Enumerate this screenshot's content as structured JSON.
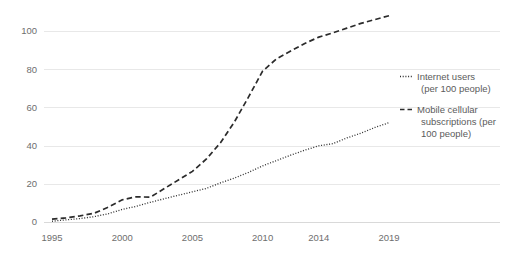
{
  "chart_data": {
    "type": "line",
    "title": "",
    "subtitle": "",
    "xlabel": "",
    "ylabel": "",
    "xlim": [
      1995,
      2019
    ],
    "ylim": [
      0,
      110
    ],
    "grid": true,
    "grid_axis": "y",
    "legend_position": "right",
    "x_tick_labels": [
      "1995",
      "2000",
      "2005",
      "2010",
      "2014",
      "2019"
    ],
    "x_tick_values": [
      1995,
      2000,
      2005,
      2010,
      2014,
      2019
    ],
    "y_tick_labels": [
      "0",
      "20",
      "40",
      "60",
      "80",
      "100"
    ],
    "y_tick_values": [
      0,
      20,
      40,
      60,
      80,
      100
    ],
    "x": [
      1995,
      1996,
      1997,
      1998,
      1999,
      2000,
      2001,
      2002,
      2003,
      2004,
      2005,
      2006,
      2007,
      2008,
      2009,
      2010,
      2011,
      2012,
      2013,
      2014,
      2015,
      2016,
      2017,
      2018,
      2019
    ],
    "series": [
      {
        "name": "Internet users (per 100 people)",
        "style": "dotted",
        "color": "#2b2b2b",
        "values": [
          0.4,
          1.1,
          1.8,
          2.8,
          4.3,
          6.6,
          8.2,
          10.3,
          12.2,
          14.0,
          15.8,
          17.6,
          20.5,
          23.0,
          26.0,
          29.4,
          32.2,
          35.0,
          37.6,
          39.9,
          41.0,
          44.0,
          46.5,
          49.5,
          52.0
        ]
      },
      {
        "name": "Mobile cellular subscriptions (per 100 people)",
        "style": "dashed",
        "color": "#2b2b2b",
        "values": [
          1.5,
          2.2,
          3.2,
          4.6,
          7.7,
          11.6,
          13.2,
          13.0,
          17.5,
          22.0,
          26.5,
          33.0,
          41.5,
          52.5,
          65.5,
          79.0,
          85.5,
          89.5,
          93.5,
          96.8,
          99.0,
          101.5,
          104.0,
          106.0,
          108.0
        ]
      }
    ],
    "legend": [
      {
        "label_line1": "Internet users",
        "label_line2": "(per 100 people)",
        "label_line3": "",
        "marker": "dotted-line-icon"
      },
      {
        "label_line1": "Mobile cellular",
        "label_line2": "subscriptions (per",
        "label_line3": "100 people)",
        "marker": "dashed-line-icon"
      }
    ],
    "colors": {
      "series": "#2b2b2b",
      "gridline": "#e8e8e8",
      "axis": "#d9d9d9",
      "tick_label": "#6e6e6e",
      "legend_label": "#5b5b5b",
      "background": "#ffffff"
    }
  }
}
